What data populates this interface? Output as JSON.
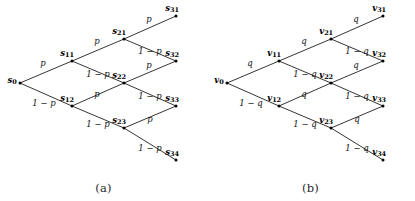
{
  "figure": {
    "background": "#ffffff",
    "line_color": "#111111",
    "text_color": "#111111",
    "width": 415,
    "height": 201
  },
  "panels": [
    {
      "id": "a",
      "caption": "(a)",
      "symbol": "s",
      "up_prob": "p",
      "down_prob": "1 − p",
      "nodes": [
        {
          "name": "s0",
          "base": "s",
          "sub": "0",
          "x": 20,
          "y": 83,
          "label_dx": -8,
          "label_dy": -2
        },
        {
          "name": "s11",
          "base": "s",
          "sub": "11",
          "x": 72,
          "y": 61,
          "label_dx": -5,
          "label_dy": -7
        },
        {
          "name": "s12",
          "base": "s",
          "sub": "12",
          "x": 72,
          "y": 106,
          "label_dx": -5,
          "label_dy": -7
        },
        {
          "name": "s21",
          "base": "s",
          "sub": "21",
          "x": 124,
          "y": 39,
          "label_dx": -5,
          "label_dy": -7
        },
        {
          "name": "s22",
          "base": "s",
          "sub": "22",
          "x": 124,
          "y": 83,
          "label_dx": -5,
          "label_dy": -7
        },
        {
          "name": "s23",
          "base": "s",
          "sub": "23",
          "x": 124,
          "y": 128,
          "label_dx": -5,
          "label_dy": -7
        },
        {
          "name": "s31",
          "base": "s",
          "sub": "31",
          "x": 176,
          "y": 16,
          "label_dx": -4,
          "label_dy": -7
        },
        {
          "name": "s32",
          "base": "s",
          "sub": "32",
          "x": 176,
          "y": 61,
          "label_dx": -4,
          "label_dy": -7
        },
        {
          "name": "s33",
          "base": "s",
          "sub": "33",
          "x": 176,
          "y": 106,
          "label_dx": -4,
          "label_dy": -7
        },
        {
          "name": "s34",
          "base": "s",
          "sub": "34",
          "x": 176,
          "y": 160,
          "label_dx": -4,
          "label_dy": -7
        }
      ],
      "edges": [
        {
          "from": "s0",
          "to": "s11",
          "label": "p",
          "lx": 43,
          "ly": 63
        },
        {
          "from": "s0",
          "to": "s12",
          "label": "1 − p",
          "lx": 44,
          "ly": 103
        },
        {
          "from": "s11",
          "to": "s21",
          "label": "p",
          "lx": 97,
          "ly": 41
        },
        {
          "from": "s11",
          "to": "s22",
          "label": "1 − p",
          "lx": 98,
          "ly": 74
        },
        {
          "from": "s12",
          "to": "s22",
          "label": "p",
          "lx": 97,
          "ly": 94
        },
        {
          "from": "s12",
          "to": "s23",
          "label": "1 − p",
          "lx": 98,
          "ly": 124
        },
        {
          "from": "s21",
          "to": "s31",
          "label": "p",
          "lx": 149,
          "ly": 19
        },
        {
          "from": "s21",
          "to": "s32",
          "label": "1 − p",
          "lx": 150,
          "ly": 51
        },
        {
          "from": "s22",
          "to": "s32",
          "label": "p",
          "lx": 149,
          "ly": 65
        },
        {
          "from": "s22",
          "to": "s33",
          "label": "1 − p",
          "lx": 150,
          "ly": 96
        },
        {
          "from": "s23",
          "to": "s33",
          "label": "p",
          "lx": 150,
          "ly": 119
        },
        {
          "from": "s23",
          "to": "s34",
          "label": "1 − p",
          "lx": 150,
          "ly": 148
        }
      ]
    },
    {
      "id": "b",
      "caption": "(b)",
      "symbol": "v",
      "up_prob": "q",
      "down_prob": "1 − q",
      "nodes": [
        {
          "name": "v0",
          "base": "v",
          "sub": "0",
          "x": 20,
          "y": 83,
          "label_dx": -8,
          "label_dy": -2
        },
        {
          "name": "v11",
          "base": "v",
          "sub": "11",
          "x": 72,
          "y": 61,
          "label_dx": -5,
          "label_dy": -7
        },
        {
          "name": "v12",
          "base": "v",
          "sub": "12",
          "x": 72,
          "y": 106,
          "label_dx": -5,
          "label_dy": -7
        },
        {
          "name": "v21",
          "base": "v",
          "sub": "21",
          "x": 124,
          "y": 39,
          "label_dx": -5,
          "label_dy": -7
        },
        {
          "name": "v22",
          "base": "v",
          "sub": "22",
          "x": 124,
          "y": 83,
          "label_dx": -5,
          "label_dy": -7
        },
        {
          "name": "v23",
          "base": "v",
          "sub": "23",
          "x": 124,
          "y": 128,
          "label_dx": -5,
          "label_dy": -7
        },
        {
          "name": "v31",
          "base": "v",
          "sub": "31",
          "x": 176,
          "y": 16,
          "label_dx": -4,
          "label_dy": -7
        },
        {
          "name": "v32",
          "base": "v",
          "sub": "32",
          "x": 176,
          "y": 61,
          "label_dx": -4,
          "label_dy": -7
        },
        {
          "name": "v33",
          "base": "v",
          "sub": "33",
          "x": 176,
          "y": 106,
          "label_dx": -4,
          "label_dy": -7
        },
        {
          "name": "v34",
          "base": "v",
          "sub": "34",
          "x": 176,
          "y": 160,
          "label_dx": -4,
          "label_dy": -7
        }
      ],
      "edges": [
        {
          "from": "v0",
          "to": "v11",
          "label": "q",
          "lx": 43,
          "ly": 63
        },
        {
          "from": "v0",
          "to": "v12",
          "label": "1 − q",
          "lx": 44,
          "ly": 103
        },
        {
          "from": "v11",
          "to": "v21",
          "label": "q",
          "lx": 97,
          "ly": 41
        },
        {
          "from": "v11",
          "to": "v22",
          "label": "1 − q",
          "lx": 98,
          "ly": 74
        },
        {
          "from": "v12",
          "to": "v22",
          "label": "q",
          "lx": 97,
          "ly": 94
        },
        {
          "from": "v12",
          "to": "v23",
          "label": "1 − q",
          "lx": 98,
          "ly": 124
        },
        {
          "from": "v21",
          "to": "v31",
          "label": "q",
          "lx": 149,
          "ly": 19
        },
        {
          "from": "v21",
          "to": "v32",
          "label": "1 − q",
          "lx": 150,
          "ly": 51
        },
        {
          "from": "v22",
          "to": "v32",
          "label": "q",
          "lx": 149,
          "ly": 65
        },
        {
          "from": "v22",
          "to": "v33",
          "label": "1 − q",
          "lx": 150,
          "ly": 96
        },
        {
          "from": "v23",
          "to": "v33",
          "label": "q",
          "lx": 150,
          "ly": 119
        },
        {
          "from": "v23",
          "to": "v34",
          "label": "1 − q",
          "lx": 150,
          "ly": 148
        }
      ]
    }
  ]
}
